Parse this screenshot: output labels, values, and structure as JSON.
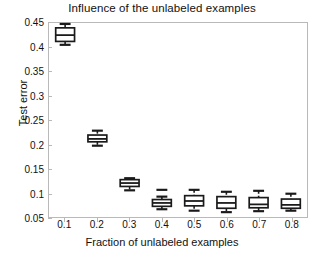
{
  "chart_data": {
    "type": "box",
    "title": "Influence of the unlabeled examples",
    "xlabel": "Fraction of unlabeled examples",
    "ylabel": "Test error",
    "grid": false,
    "legend": null,
    "xlim": [
      0.05,
      0.85
    ],
    "ylim": [
      0.05,
      0.45
    ],
    "xticks": [
      "0.1",
      "0.2",
      "0.3",
      "0.4",
      "0.5",
      "0.6",
      "0.7",
      "0.8"
    ],
    "yticks": [
      "0.05",
      "0.1",
      "0.15",
      "0.2",
      "0.25",
      "0.3",
      "0.35",
      "0.4",
      "0.45"
    ],
    "categories": [
      0.1,
      0.2,
      0.3,
      0.4,
      0.5,
      0.6,
      0.7,
      0.8
    ],
    "boxes": [
      {
        "x": 0.1,
        "whisker_low": 0.405,
        "q1": 0.412,
        "median": 0.425,
        "q3": 0.44,
        "whisker_high": 0.448
      },
      {
        "x": 0.2,
        "whisker_low": 0.197,
        "q1": 0.205,
        "median": 0.211,
        "q3": 0.219,
        "whisker_high": 0.228
      },
      {
        "x": 0.3,
        "whisker_low": 0.105,
        "q1": 0.113,
        "median": 0.12,
        "q3": 0.127,
        "whisker_high": 0.13
      },
      {
        "x": 0.4,
        "whisker_low": 0.066,
        "q1": 0.072,
        "median": 0.079,
        "q3": 0.086,
        "whisker_high": 0.092,
        "outlier_cap": 0.106
      },
      {
        "x": 0.5,
        "whisker_low": 0.063,
        "q1": 0.073,
        "median": 0.083,
        "q3": 0.094,
        "whisker_high": 0.106
      },
      {
        "x": 0.6,
        "whisker_low": 0.06,
        "q1": 0.068,
        "median": 0.079,
        "q3": 0.092,
        "whisker_high": 0.102
      },
      {
        "x": 0.7,
        "whisker_low": 0.062,
        "q1": 0.069,
        "median": 0.076,
        "q3": 0.09,
        "whisker_high": 0.104
      },
      {
        "x": 0.8,
        "whisker_low": 0.063,
        "q1": 0.068,
        "median": 0.075,
        "q3": 0.087,
        "whisker_high": 0.098
      }
    ],
    "style": {
      "box_line_color": "#1a1a1a",
      "box_fill_color": "#ffffff",
      "median_color": "#1a1a1a",
      "whisker_color": "#1a1a1a",
      "frame_color": "#b9b9b9",
      "text_color": "#111111"
    }
  }
}
